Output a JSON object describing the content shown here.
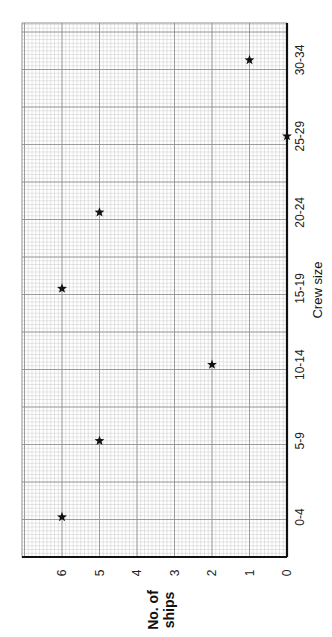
{
  "chart_data": {
    "type": "scatter",
    "orientation": "rotated-90-ccw",
    "title": "",
    "xlabel": "Crew size",
    "ylabel": "No. of ships",
    "categories": [
      "0-4",
      "5-9",
      "10-14",
      "15-19",
      "20-24",
      "25-29",
      "30-34"
    ],
    "values": [
      6,
      5,
      2,
      6,
      5,
      0,
      1
    ],
    "y_ticks": [
      "0",
      "1",
      "2",
      "3",
      "4",
      "5",
      "6"
    ],
    "ylim": [
      0,
      7
    ],
    "grid": true,
    "marker": "star",
    "legend": null
  },
  "colors": {
    "background": "#ffffff",
    "minor_grid": "#c8c8c8",
    "major_grid": "#8a8a8a",
    "axis": "#111111",
    "marker": "#111111"
  }
}
